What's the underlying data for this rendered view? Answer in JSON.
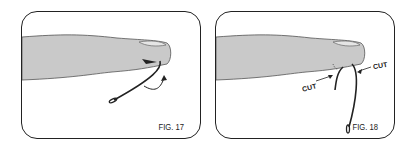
{
  "figures": [
    {
      "label": "FIG. 17",
      "description": "Fishhook embedded in fingertip with curved arrow showing push-through direction"
    },
    {
      "label": "FIG. 18",
      "description": "Hook pushed through fingertip; barb cut off at two points"
    }
  ],
  "annotations": {
    "cut_left": "CUT",
    "cut_right": "CUT"
  },
  "colors": {
    "finger": "#c9c9c9",
    "outline": "#222222"
  }
}
